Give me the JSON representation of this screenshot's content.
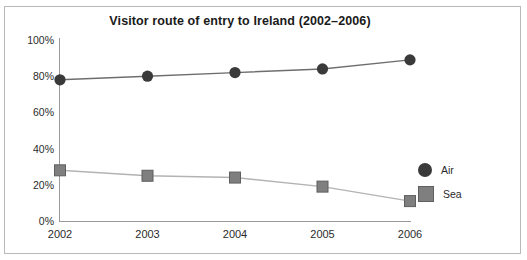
{
  "chart_data": {
    "type": "line",
    "title": "Visitor route of entry to Ireland (2002–2006)",
    "xlabel": "",
    "ylabel": "",
    "categories": [
      "2002",
      "2003",
      "2004",
      "2005",
      "2006"
    ],
    "series": [
      {
        "name": "Air",
        "values": [
          78,
          80,
          82,
          84,
          89
        ],
        "marker": "circle",
        "color": "#3a3a3a"
      },
      {
        "name": "Sea",
        "values": [
          28,
          25,
          24,
          19,
          11
        ],
        "marker": "square",
        "color": "#7f7f7f"
      }
    ],
    "ylim": [
      0,
      100
    ],
    "ytick_labels": [
      "100%",
      "80%",
      "60%",
      "40%",
      "20%",
      "0%"
    ],
    "ytick_values": [
      100,
      80,
      60,
      40,
      20,
      0
    ],
    "grid": false,
    "legend_position": "right"
  },
  "legend": {
    "items": [
      {
        "label": "Air",
        "marker": "circle",
        "color": "#3a3a3a"
      },
      {
        "label": "Sea",
        "marker": "square",
        "color": "#7f7f7f"
      }
    ]
  },
  "colors": {
    "air": "#3a3a3a",
    "sea": "#7f7f7f",
    "air_line": "#6e6e6e",
    "sea_line": "#b3b3b3",
    "axis": "#9a9a9a",
    "frame": "#b9b9b9",
    "text": "#2b2b2b",
    "title": "#1a1a1a"
  }
}
